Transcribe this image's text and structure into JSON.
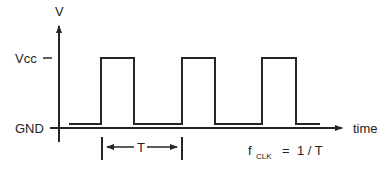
{
  "diagram": {
    "y_axis_label": "V",
    "x_axis_label": "time",
    "levels": {
      "high": "Vcc",
      "low": "GND"
    },
    "period_label": "T",
    "formula": {
      "lhs": "f",
      "subscript": "CLK",
      "rhs": "=  1 / T"
    },
    "pulses": [
      {
        "rise_x": 101,
        "fall_x": 134
      },
      {
        "rise_x": 182,
        "fall_x": 215
      },
      {
        "rise_x": 262,
        "fall_x": 296
      }
    ],
    "colors": {
      "stroke": "#262626",
      "text": "#222222",
      "background": "#ffffff"
    }
  }
}
